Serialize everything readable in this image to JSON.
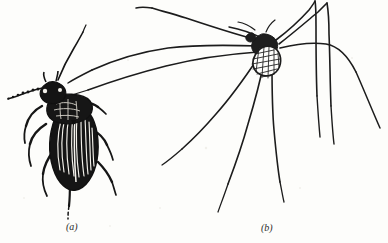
{
  "figure": {
    "type": "scientific-line-illustration",
    "background_color": "#fdfdfb",
    "ink_color": "#1a1a1a",
    "width": 388,
    "height": 243,
    "panels": [
      {
        "id": "a",
        "caption": "(a)",
        "subject": "ground beetle",
        "style": "solid black stippled engraving with striated elytra",
        "features": [
          "segmented beaded left antenna",
          "upward right antenna",
          "pronotum",
          "striated elytra",
          "six legs"
        ]
      },
      {
        "id": "b",
        "caption": "(b)",
        "subject": "crane fly",
        "style": "fine pen line drawing with cross-hatched body",
        "features": [
          "cross-hatched thorax and abdomen",
          "two long forward-reaching left legs",
          "two raised legs toward upper right",
          "five long descending legs"
        ]
      }
    ]
  },
  "captions": {
    "panel_a_label": "(a)",
    "panel_b_label": "(b)"
  }
}
